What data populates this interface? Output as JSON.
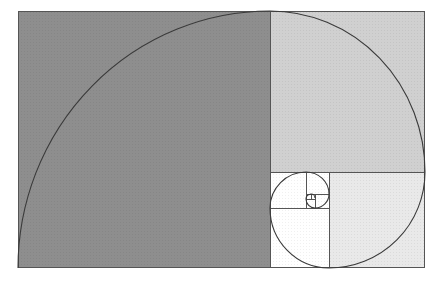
{
  "diagram": {
    "type": "golden-rectangle-spiral",
    "colors": {
      "background": "#ffffff",
      "square_1": "#8c8c8c",
      "square_2": "#cfcfcf",
      "square_3": "#e6e6e6",
      "square_small": "#ffffff",
      "stroke": "#444444"
    },
    "squares": [
      {
        "id": "sq1",
        "x": 18,
        "y": 11,
        "size": 252,
        "fill": "#8c8c8c"
      },
      {
        "id": "sq2",
        "x": 270,
        "y": 11,
        "w": 155,
        "h": 161,
        "fill": "#cfcfcf"
      },
      {
        "id": "sq3",
        "x": 329,
        "y": 172,
        "size": 96,
        "fill": "#e8e8e8"
      },
      {
        "id": "sq4",
        "x": 270,
        "y": 208,
        "w": 59,
        "h": 60,
        "fill": "#ffffff"
      },
      {
        "id": "sq5",
        "x": 270,
        "y": 172,
        "size": 36,
        "fill": "#ffffff"
      },
      {
        "id": "sq6",
        "x": 306,
        "y": 172,
        "w": 23,
        "h": 22,
        "fill": "#ffffff"
      },
      {
        "id": "sq7",
        "x": 315,
        "y": 194,
        "size": 14,
        "fill": "#ffffff"
      },
      {
        "id": "sq8",
        "x": 306,
        "y": 199,
        "w": 9,
        "h": 9,
        "fill": "#ffffff"
      },
      {
        "id": "sq9",
        "x": 306,
        "y": 194,
        "w": 6,
        "h": 5,
        "fill": "#ffffff"
      }
    ]
  }
}
